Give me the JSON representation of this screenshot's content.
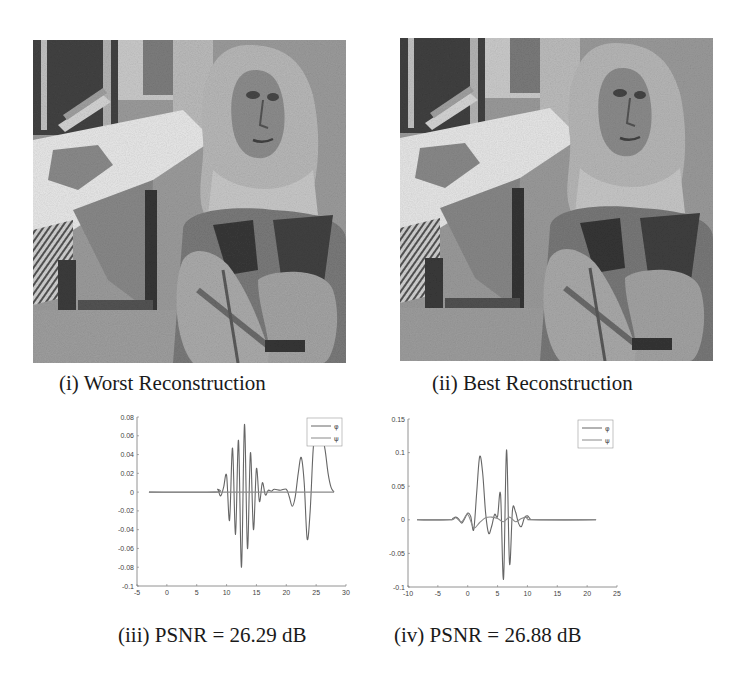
{
  "figure": {
    "panels": [
      {
        "id": "i",
        "caption": "(i) Worst Reconstruction",
        "image_subject": "woman with headscarf seated at table (grayscale reconstruction)"
      },
      {
        "id": "ii",
        "caption": "(ii) Best Reconstruction",
        "image_subject": "woman with headscarf seated at table (grayscale reconstruction)"
      },
      {
        "id": "iii",
        "caption": "(iii) PSNR = 26.29 dB"
      },
      {
        "id": "iv",
        "caption": "(iv) PSNR = 26.88 dB"
      }
    ]
  },
  "chart_data": [
    {
      "type": "line",
      "panel": "iii",
      "title": "",
      "xlabel": "",
      "ylabel": "",
      "xlim": [
        -5,
        30
      ],
      "ylim": [
        -0.1,
        0.08
      ],
      "xticks": [
        "-5",
        "0",
        "5",
        "10",
        "15",
        "20",
        "25",
        "30"
      ],
      "yticks": [
        "0.08",
        "0.06",
        "0.04",
        "0.02",
        "0",
        "-0.02",
        "-0.04",
        "-0.06",
        "-0.08",
        "-0.1"
      ],
      "legend": [
        "φ",
        "ψ"
      ],
      "legend_position": "upper right",
      "grid": false,
      "series": [
        {
          "name": "φ",
          "x": [
            -3,
            8,
            8.5,
            9,
            9.5,
            10,
            10.5,
            11,
            11.5,
            12,
            12.5,
            13,
            13.5,
            14,
            14.5,
            15,
            15.5,
            16,
            16.5,
            17,
            17.5,
            18,
            19,
            20,
            20.5,
            21,
            21.5,
            22,
            22.5,
            23,
            23.5,
            24,
            24.5,
            25,
            25.5,
            26,
            26.5,
            27,
            27.5,
            28
          ],
          "y": [
            0,
            0,
            0.003,
            -0.004,
            0.005,
            0.018,
            -0.03,
            0.047,
            -0.045,
            0.055,
            -0.08,
            0.072,
            -0.06,
            0.042,
            -0.04,
            0.025,
            -0.01,
            0.01,
            -0.003,
            0.002,
            0.001,
            0.003,
            0.002,
            0.003,
            -0.005,
            -0.015,
            -0.005,
            0.02,
            0.037,
            0.01,
            -0.05,
            -0.02,
            0.045,
            0.072,
            0.05,
            0.058,
            0.045,
            0.02,
            0.005,
            0
          ]
        },
        {
          "name": "ψ",
          "x": [
            -3,
            28
          ],
          "y": [
            0,
            0
          ]
        }
      ]
    },
    {
      "type": "line",
      "panel": "iv",
      "title": "",
      "xlabel": "",
      "ylabel": "",
      "xlim": [
        -10,
        25
      ],
      "ylim": [
        -0.1,
        0.15
      ],
      "xticks": [
        "-10",
        "-5",
        "0",
        "5",
        "10",
        "15",
        "20",
        "25"
      ],
      "yticks": [
        "0.15",
        "0.1",
        "0.05",
        "0",
        "-0.05",
        "-0.1"
      ],
      "legend": [
        "φ",
        "ψ"
      ],
      "legend_position": "upper right",
      "grid": false,
      "series": [
        {
          "name": "φ",
          "x": [
            -8.5,
            -3,
            -2.5,
            -2,
            -1.5,
            -1,
            -0.5,
            0,
            0.5,
            1,
            1.5,
            2,
            2.5,
            3,
            3.5,
            4,
            4.5,
            5,
            5.5,
            6,
            6.5,
            7,
            7.5,
            8,
            8.5,
            9,
            9.5,
            10,
            10.5,
            11,
            21.5
          ],
          "y": [
            0,
            0,
            0.002,
            0.004,
            0.001,
            -0.005,
            0.002,
            0.01,
            0.005,
            -0.015,
            0.04,
            0.094,
            0.07,
            0.01,
            -0.02,
            -0.01,
            0.008,
            0.005,
            0.038,
            -0.088,
            0.104,
            -0.065,
            0.015,
            0.012,
            -0.005,
            -0.01,
            0.003,
            0.006,
            0.001,
            0,
            0
          ]
        },
        {
          "name": "ψ",
          "x": [
            -8.5,
            -3,
            -2,
            -1,
            0,
            1,
            2,
            3,
            4,
            5,
            6,
            7,
            8,
            9,
            10,
            11,
            21.5
          ],
          "y": [
            0,
            0,
            0.003,
            -0.003,
            0.008,
            -0.012,
            -0.004,
            0.003,
            0.004,
            0.002,
            -0.003,
            0.004,
            -0.003,
            0.002,
            0.004,
            0,
            0
          ]
        }
      ]
    }
  ],
  "colors": {
    "axis": "#777777",
    "curve_phi": "#666666",
    "curve_psi": "#8a8a8a",
    "caption_text": "#1a1a1a"
  }
}
